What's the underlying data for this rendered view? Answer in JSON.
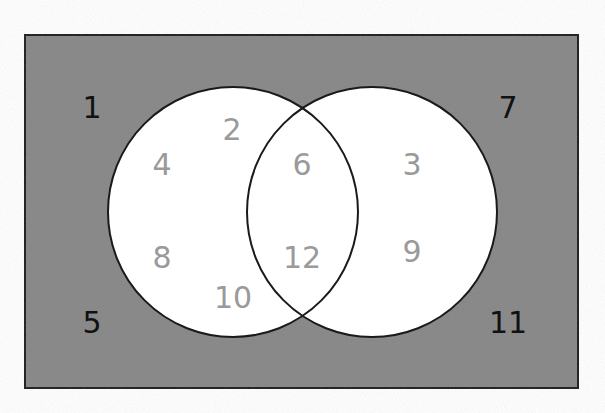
{
  "diagram": {
    "type": "venn",
    "colors": {
      "universe_fill": "#8a8a8a",
      "circle_fill": "#ffffff",
      "outline": "#1a1a1a",
      "outside_text": "#111111",
      "inside_text": "#9a9a9a"
    },
    "outside": [
      {
        "value": "1",
        "x": 92,
        "y": 118
      },
      {
        "value": "7",
        "x": 508,
        "y": 118
      },
      {
        "value": "5",
        "x": 92,
        "y": 333
      },
      {
        "value": "11",
        "x": 508,
        "y": 333
      }
    ],
    "left_only": [
      {
        "value": "2",
        "x": 232,
        "y": 140
      },
      {
        "value": "4",
        "x": 162,
        "y": 175
      },
      {
        "value": "8",
        "x": 162,
        "y": 268
      },
      {
        "value": "10",
        "x": 233,
        "y": 308
      }
    ],
    "intersection": [
      {
        "value": "6",
        "x": 302,
        "y": 175
      },
      {
        "value": "12",
        "x": 302,
        "y": 268
      }
    ],
    "right_only": [
      {
        "value": "3",
        "x": 412,
        "y": 175
      },
      {
        "value": "9",
        "x": 412,
        "y": 262
      }
    ]
  }
}
